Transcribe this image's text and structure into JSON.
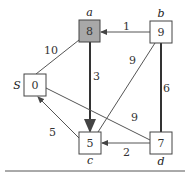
{
  "diagram": {
    "nodes": [
      {
        "id": "a",
        "name": "a",
        "value": "8",
        "x": 79,
        "y": 20,
        "shaded": true
      },
      {
        "id": "b",
        "name": "b",
        "value": "9",
        "x": 150,
        "y": 21,
        "shaded": false
      },
      {
        "id": "S",
        "name": "S",
        "value": "0",
        "x": 24,
        "y": 74,
        "shaded": false
      },
      {
        "id": "c",
        "name": "c",
        "value": "5",
        "x": 79,
        "y": 132,
        "shaded": false
      },
      {
        "id": "d",
        "name": "d",
        "value": "7",
        "x": 150,
        "y": 132,
        "shaded": false
      }
    ],
    "edges": [
      {
        "from": "b",
        "to": "a",
        "weight": "1",
        "bold": false
      },
      {
        "from": "a",
        "to": "S",
        "weight": "10",
        "bold": false
      },
      {
        "from": "a",
        "to": "c",
        "weight": "3",
        "bold": true
      },
      {
        "from": "b",
        "to": "c",
        "weight": "9",
        "bold": false
      },
      {
        "from": "b",
        "to": "d",
        "weight": "6",
        "bold": true
      },
      {
        "from": "S",
        "to": "d",
        "weight": "9",
        "bold": false
      },
      {
        "from": "c",
        "to": "S",
        "weight": "5",
        "bold": false
      },
      {
        "from": "d",
        "to": "c",
        "weight": "2",
        "bold": false
      }
    ],
    "colors": {
      "shaded_node": "#a8a8a8",
      "stroke": "#444444"
    }
  }
}
